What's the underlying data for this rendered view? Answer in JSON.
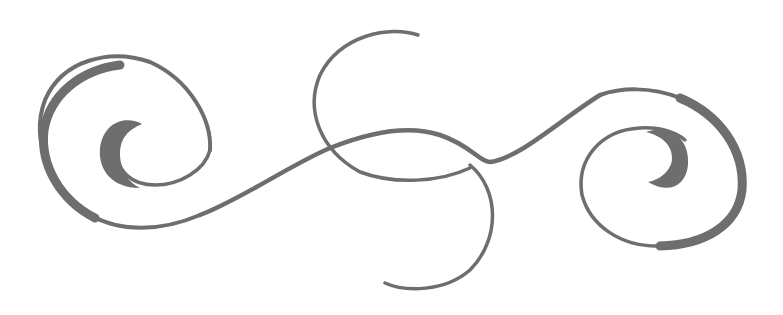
{
  "image": {
    "description": "Decorative grey flourish ornament with two spirals joined by an S-curve and a central loop",
    "background_color": "#ffffff",
    "stroke_color": "#6e6e6e",
    "elements": [
      {
        "name": "left-spiral",
        "icon": "spiral-left"
      },
      {
        "name": "center-loop",
        "icon": "loop"
      },
      {
        "name": "connecting-curve",
        "icon": "s-curve"
      },
      {
        "name": "right-spiral",
        "icon": "spiral-right"
      }
    ]
  }
}
